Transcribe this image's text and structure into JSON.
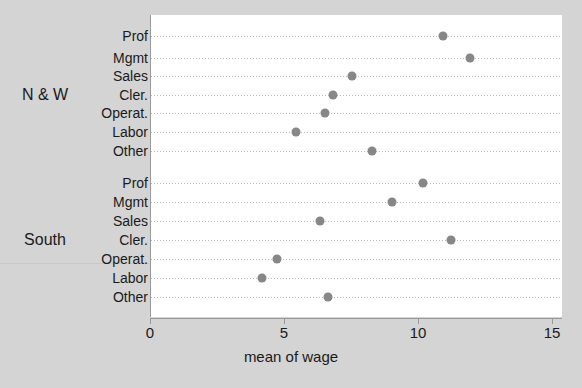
{
  "chart_data": {
    "type": "scatter",
    "title": "",
    "xlabel": "mean of wage",
    "ylabel": "",
    "xlim": [
      0,
      15
    ],
    "xticks": [
      0,
      5,
      10,
      15
    ],
    "xtick_labels": [
      "0",
      "5",
      "10",
      "15"
    ],
    "grid": "dotted horizontal rows",
    "legend": "none",
    "marker_color": "#878787",
    "panel_background": "#ffffff",
    "figure_background": "#d4d4d4",
    "groups": [
      {
        "name": "N & W",
        "categories": [
          "Prof",
          "Mgmt",
          "Sales",
          "Cler.",
          "Operat.",
          "Labor",
          "Other"
        ],
        "values": [
          10.9,
          11.9,
          7.5,
          6.8,
          6.5,
          5.4,
          8.25
        ]
      },
      {
        "name": "South",
        "categories": [
          "Prof",
          "Mgmt",
          "Sales",
          "Cler.",
          "Operat.",
          "Labor",
          "Other"
        ],
        "values": [
          10.15,
          9.0,
          6.3,
          11.2,
          4.7,
          4.15,
          6.6
        ]
      }
    ]
  },
  "axis": {
    "x_title": "mean of wage",
    "tick_labels": [
      "0",
      "5",
      "10",
      "15"
    ]
  }
}
